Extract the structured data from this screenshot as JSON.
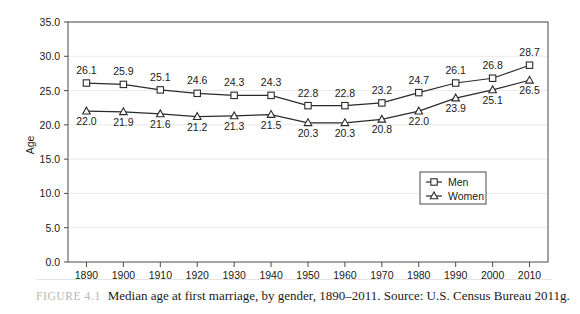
{
  "figure": {
    "label": "FIGURE 4.1",
    "caption": "Median age at first marriage, by gender, 1890–2011. Source: U.S. Census Bureau 2011g."
  },
  "colors": {
    "line": "#2b2b2b",
    "axis": "#4a4a4a",
    "grid": "#eceae7",
    "marker_fill": "#ffffff",
    "label_text": "#1a1a1a",
    "caption_label": "#b9b6b2"
  },
  "chart_data": {
    "type": "line",
    "title": "",
    "xlabel": "",
    "ylabel": "Age",
    "categories": [
      "1890",
      "1900",
      "1910",
      "1920",
      "1930",
      "1940",
      "1950",
      "1960",
      "1970",
      "1980",
      "1990",
      "2000",
      "2010"
    ],
    "yticks": [
      "0.0",
      "5.0",
      "10.0",
      "15.0",
      "20.0",
      "25.0",
      "30.0",
      "35.0"
    ],
    "ylim": [
      0,
      35
    ],
    "grid": true,
    "legend_position": "center-right",
    "series": [
      {
        "name": "Men",
        "marker": "square",
        "label_position": "above",
        "values": [
          26.1,
          25.9,
          25.1,
          24.6,
          24.3,
          24.3,
          22.8,
          22.8,
          23.2,
          24.7,
          26.1,
          26.8,
          28.7
        ]
      },
      {
        "name": "Women",
        "marker": "triangle",
        "label_position": "below",
        "values": [
          22.0,
          21.9,
          21.6,
          21.2,
          21.3,
          21.5,
          20.3,
          20.3,
          20.8,
          22.0,
          23.9,
          25.1,
          26.5
        ]
      }
    ]
  }
}
